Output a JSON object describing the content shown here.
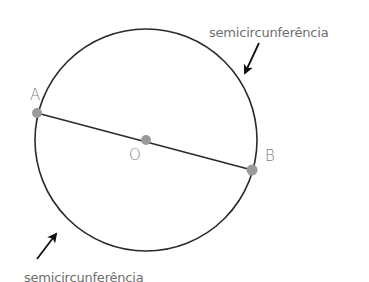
{
  "diagram": {
    "type": "geometry",
    "circle": {
      "center": {
        "x": 146,
        "y": 140
      },
      "radius": 111,
      "stroke": "#2a2a2a"
    },
    "points": [
      {
        "id": "A",
        "label": "A",
        "x": 37,
        "y": 113
      },
      {
        "id": "O",
        "label": "O",
        "x": 146,
        "y": 140
      },
      {
        "id": "B",
        "label": "B",
        "x": 252,
        "y": 170
      }
    ],
    "segment": {
      "from": "A",
      "to": "B",
      "kind": "diameter"
    },
    "point_color": "#9a9a9a",
    "annotations": [
      {
        "id": "upper",
        "text": "semicircunferência"
      },
      {
        "id": "lower",
        "text": "semicircunferência"
      }
    ]
  }
}
